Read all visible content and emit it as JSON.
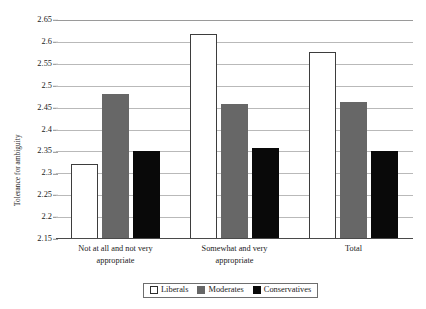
{
  "chart_data": {
    "type": "bar",
    "title": "",
    "xlabel": "",
    "ylabel": "Tolerance for ambiguity",
    "ylim": [
      2.15,
      2.65
    ],
    "ytick_step": 0.05,
    "yticks": [
      "2.65",
      "2.6",
      "2.55",
      "2.5",
      "2.45",
      "2.4",
      "2.35",
      "2.3",
      "2.25",
      "2.2",
      "2.15"
    ],
    "ytick_values": [
      2.65,
      2.6,
      2.55,
      2.5,
      2.45,
      2.4,
      2.35,
      2.3,
      2.25,
      2.2,
      2.15
    ],
    "grid": true,
    "grid_axis": "y",
    "legend_position": "bottom",
    "categories": [
      "Not at all and not very appropriate",
      "Somewhat and very appropriate",
      "Total"
    ],
    "categories_lines": [
      [
        "Not at all and not very",
        "appropriate"
      ],
      [
        "Somewhat and very",
        "appropriate"
      ],
      [
        "Total",
        ""
      ]
    ],
    "series": [
      {
        "name": "Liberals",
        "color": "#ffffff",
        "values": [
          2.322,
          2.617,
          2.578
        ]
      },
      {
        "name": "Moderates",
        "color": "#676767",
        "values": [
          2.482,
          2.458,
          2.463
        ]
      },
      {
        "name": "Conservatives",
        "color": "#090909",
        "values": [
          2.35,
          2.358,
          2.35
        ]
      }
    ]
  },
  "legend": {
    "items": [
      {
        "label": "Liberals",
        "key": "liberals"
      },
      {
        "label": "Moderates",
        "key": "moderates"
      },
      {
        "label": "Conservatives",
        "key": "conservatives"
      }
    ]
  }
}
